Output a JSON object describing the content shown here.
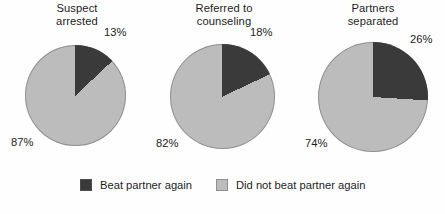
{
  "chart_data": {
    "type": "pie",
    "title": "",
    "subtitle": "",
    "xlabel": "",
    "ylabel": "",
    "grid": false,
    "legend_position": "bottom",
    "legend": [
      "Beat partner again",
      "Did not beat partner again"
    ],
    "colors": {
      "beat_partner_again": "#3a3a3a",
      "did_not_beat_partner_again": "#bcbcbc",
      "background": "#fefefe",
      "text": "#1d1d1d"
    },
    "panels": [
      {
        "title": "Suspect\narrested",
        "title_lines": [
          "Suspect",
          "arrested"
        ],
        "categories": [
          "Beat partner again",
          "Did not beat partner again"
        ],
        "values": [
          13,
          87
        ],
        "labels": [
          "13%",
          "82%"
        ],
        "slice_labels": {
          "dark": "13%",
          "light": "87%"
        }
      },
      {
        "title": "Referred to\ncounseling",
        "title_lines": [
          "Referred to",
          "counseling"
        ],
        "categories": [
          "Beat partner again",
          "Did not beat partner again"
        ],
        "values": [
          18,
          82
        ],
        "labels": [
          "18%",
          "82%"
        ],
        "slice_labels": {
          "dark": "18%",
          "light": "82%"
        }
      },
      {
        "title": "Partners\nseparated",
        "title_lines": [
          "Partners",
          "separated"
        ],
        "categories": [
          "Beat partner again",
          "Did not beat partner again"
        ],
        "values": [
          26,
          74
        ],
        "labels": [
          "26%",
          "74%"
        ],
        "slice_labels": {
          "dark": "26%",
          "light": "74%"
        }
      }
    ]
  },
  "figure": {
    "panels": [
      {
        "title": "Suspect\narrested",
        "pct_dark": "13%",
        "pct_light": "87%",
        "dark_pct_value": 13
      },
      {
        "title": "Referred to\ncounseling",
        "pct_dark": "18%",
        "pct_light": "82%",
        "dark_pct_value": 18
      },
      {
        "title": "Partners\nseparated",
        "pct_dark": "26%",
        "pct_light": "74%",
        "dark_pct_value": 26
      }
    ],
    "legend": {
      "items": [
        {
          "label": "Beat partner again",
          "color": "#3a3a3a"
        },
        {
          "label": "Did not beat partner again",
          "color": "#bcbcbc"
        }
      ]
    }
  }
}
